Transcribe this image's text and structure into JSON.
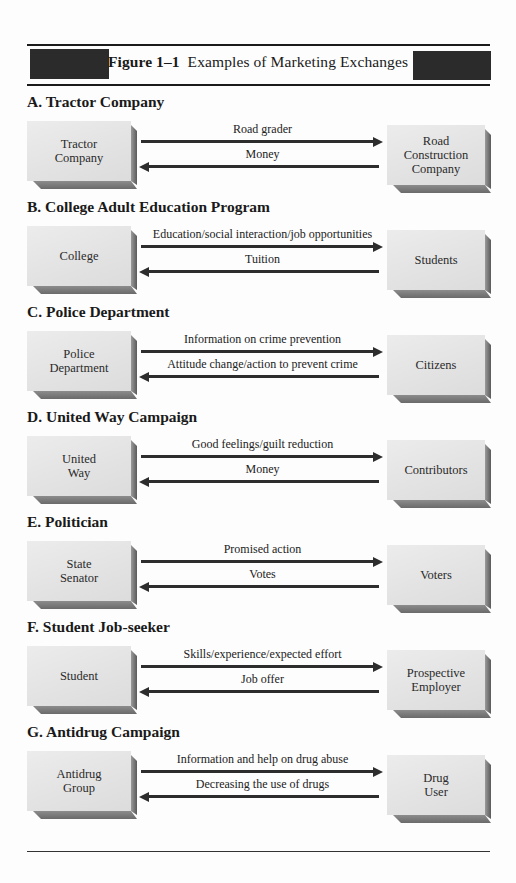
{
  "figure": {
    "label": "Figure 1–1",
    "title": "Examples of Marketing Exchanges"
  },
  "sections": [
    {
      "title": "A. Tractor Company",
      "left": "Tractor\nCompany",
      "right": "Road\nConstruction\nCompany",
      "to_right": "Road grader",
      "to_left": "Money"
    },
    {
      "title": "B. College Adult Education Program",
      "left": "College",
      "right": "Students",
      "to_right": "Education/social interaction/job opportunities",
      "to_left": "Tuition"
    },
    {
      "title": "C. Police Department",
      "left": "Police\nDepartment",
      "right": "Citizens",
      "to_right": "Information on crime prevention",
      "to_left": "Attitude change/action to prevent crime"
    },
    {
      "title": "D. United Way Campaign",
      "left": "United\nWay",
      "right": "Contributors",
      "to_right": "Good feelings/guilt reduction",
      "to_left": "Money"
    },
    {
      "title": "E. Politician",
      "left": "State\nSenator",
      "right": "Voters",
      "to_right": "Promised action",
      "to_left": "Votes"
    },
    {
      "title": "F. Student Job-seeker",
      "left": "Student",
      "right": "Prospective\nEmployer",
      "to_right": "Skills/experience/expected effort",
      "to_left": "Job offer"
    },
    {
      "title": "G. Antidrug Campaign",
      "left": "Antidrug\nGroup",
      "right": "Drug\nUser",
      "to_right": "Information and help on drug abuse",
      "to_left": "Decreasing the use of drugs"
    }
  ]
}
